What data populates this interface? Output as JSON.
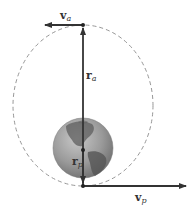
{
  "diagram": {
    "orbit": {
      "style": "dashed",
      "color": "#888888"
    },
    "body": {
      "name": "Earth",
      "colors": {
        "ocean": "#9a9a9a",
        "land": "#5e5e5e"
      }
    },
    "vectors": {
      "v_a": {
        "symbol": "v",
        "subscript": "a",
        "direction": "left"
      },
      "r_a": {
        "symbol": "r",
        "subscript": "a",
        "direction": "up"
      },
      "r_p": {
        "symbol": "r",
        "subscript": "p",
        "direction": "down"
      },
      "v_p": {
        "symbol": "v",
        "subscript": "p",
        "direction": "right"
      }
    },
    "line_color": "#333333"
  }
}
